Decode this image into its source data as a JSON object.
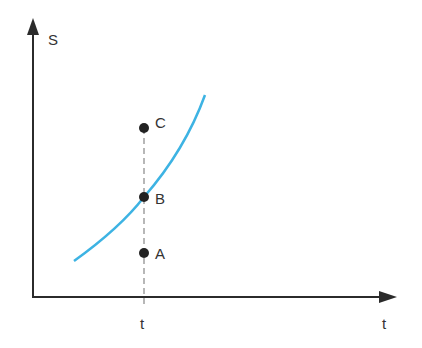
{
  "diagram": {
    "y_axis_label": "S",
    "x_axis_label": "t",
    "x_tick_label": "t",
    "points": [
      {
        "label": "C"
      },
      {
        "label": "B"
      },
      {
        "label": "A"
      }
    ],
    "colors": {
      "curve": "#3db3e3",
      "axis": "#2b2b2b",
      "point": "#222222",
      "dashed": "#888888"
    }
  }
}
